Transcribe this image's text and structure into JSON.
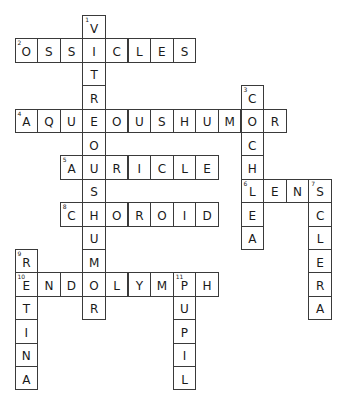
{
  "puzzle": {
    "grid_origin": {
      "x": 14.5,
      "y": 15
    },
    "cell_size": {
      "w": 22.6,
      "h": 23.4
    },
    "words": [
      {
        "number": 1,
        "direction": "down",
        "answer": "VITREOUSHUMOR",
        "row": 0,
        "col": 3
      },
      {
        "number": 2,
        "direction": "across",
        "answer": "OSSICLES",
        "row": 1,
        "col": 0
      },
      {
        "number": 3,
        "direction": "down",
        "answer": "COCHLEA",
        "row": 3,
        "col": 10
      },
      {
        "number": 4,
        "direction": "across",
        "answer": "AQUEOUSHUMOR",
        "row": 4,
        "col": 0
      },
      {
        "number": 5,
        "direction": "across",
        "answer": "AURICLE",
        "row": 6,
        "col": 2
      },
      {
        "number": 6,
        "direction": "across",
        "answer": "LENS",
        "row": 7,
        "col": 10
      },
      {
        "number": 7,
        "direction": "down",
        "answer": "SCLERA",
        "row": 7,
        "col": 13
      },
      {
        "number": 8,
        "direction": "across",
        "answer": "CHOROID",
        "row": 8,
        "col": 2
      },
      {
        "number": 9,
        "direction": "down",
        "answer": "RETINA",
        "row": 10,
        "col": 0
      },
      {
        "number": 10,
        "direction": "across",
        "answer": "ENDOLYMPH",
        "row": 11,
        "col": 0
      },
      {
        "number": 11,
        "direction": "down",
        "answer": "PUPIL",
        "row": 11,
        "col": 7
      }
    ]
  }
}
